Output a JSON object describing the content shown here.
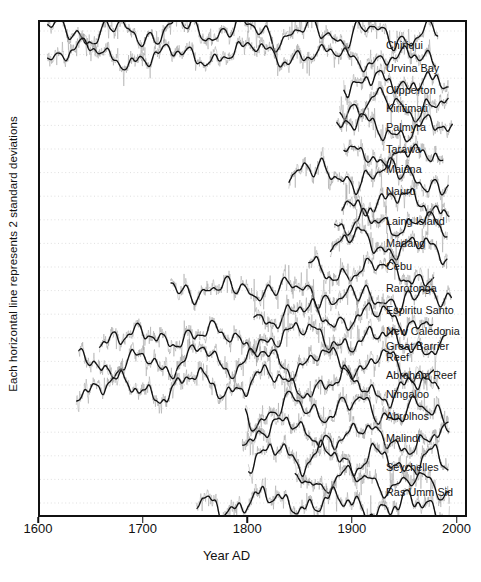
{
  "figure": {
    "axis": {
      "ylabel": "Each horizontal line represents 2 standard deviations",
      "xlabel": "Year AD",
      "xticks": [
        "1600",
        "1700",
        "1800",
        "1900",
        "2000"
      ]
    }
  },
  "chart_data": {
    "type": "line",
    "title": "",
    "xlabel": "Year AD",
    "ylabel": "Each horizontal line represents 2 standard deviations",
    "xlim": [
      1600,
      2010
    ],
    "xticks": [
      1600,
      1700,
      1800,
      1900,
      2000
    ],
    "grid": true,
    "grid_axis": "y",
    "grid_style": "dotted",
    "legend": "right-side inline labels",
    "y_axis_note": "Stacked coral oxygen-isotope records; each record offset vertically. Each horizontal gridline represents 2 standard deviations.",
    "series": [
      {
        "name": "Chiriqui",
        "label": "Chiriqui",
        "start_year": 1607,
        "end_year": 1984,
        "offset_index": 0,
        "label_y_px": 45
      },
      {
        "name": "Urvina Bay",
        "label": "Urvina Bay",
        "start_year": 1607,
        "end_year": 1982,
        "offset_index": 1,
        "label_y_px": 68
      },
      {
        "name": "Clipperton",
        "label": "Clipperton",
        "start_year": 1893,
        "end_year": 1994,
        "offset_index": 2,
        "label_y_px": 90
      },
      {
        "name": "Kiritimati",
        "label": "Kiritimati",
        "start_year": 1889,
        "end_year": 1994,
        "offset_index": 3,
        "label_y_px": 108
      },
      {
        "name": "Palmyra",
        "label": "Palmyra",
        "start_year": 1886,
        "end_year": 1998,
        "offset_index": 4,
        "label_y_px": 127
      },
      {
        "name": "Tarawa",
        "label": "Tarawa",
        "start_year": 1893,
        "end_year": 1989,
        "offset_index": 5,
        "label_y_px": 149
      },
      {
        "name": "Maiana",
        "label": "Maiana",
        "start_year": 1840,
        "end_year": 1994,
        "offset_index": 6,
        "label_y_px": 169
      },
      {
        "name": "Nauru",
        "label": "Nauru",
        "start_year": 1891,
        "end_year": 1995,
        "offset_index": 7,
        "label_y_px": 191
      },
      {
        "name": "Laing Island",
        "label": "Laing Island",
        "start_year": 1884,
        "end_year": 1993,
        "offset_index": 8,
        "label_y_px": 221
      },
      {
        "name": "Madang",
        "label": "Madang",
        "start_year": 1880,
        "end_year": 1993,
        "offset_index": 9,
        "label_y_px": 243
      },
      {
        "name": "Cebu",
        "label": "Cebu",
        "start_year": 1859,
        "end_year": 1980,
        "offset_index": 10,
        "label_y_px": 266
      },
      {
        "name": "Rarotonga",
        "label": "Rarotonga",
        "start_year": 1726,
        "end_year": 1997,
        "offset_index": 11,
        "label_y_px": 288
      },
      {
        "name": "Espiritu Santo",
        "label": "Espiritu Santo",
        "start_year": 1806,
        "end_year": 1979,
        "offset_index": 12,
        "label_y_px": 310
      },
      {
        "name": "New Caledonia",
        "label": "New Caledonia",
        "start_year": 1657,
        "end_year": 1992,
        "offset_index": 13,
        "label_y_px": 331
      },
      {
        "name": "Great Barrier Reef",
        "label": "Great Barrier\nReef",
        "start_year": 1637,
        "end_year": 1980,
        "offset_index": 14,
        "label_y_px": 351
      },
      {
        "name": "Abraham Reef",
        "label": "Abraham Reef",
        "start_year": 1635,
        "end_year": 1985,
        "offset_index": 15,
        "label_y_px": 375
      },
      {
        "name": "Ningaloo",
        "label": "Ningaloo",
        "start_year": 1798,
        "end_year": 1995,
        "offset_index": 16,
        "label_y_px": 394
      },
      {
        "name": "Abrolhos",
        "label": "Abrolhos",
        "start_year": 1795,
        "end_year": 1994,
        "offset_index": 17,
        "label_y_px": 416
      },
      {
        "name": "Malindi",
        "label": "Malindi",
        "start_year": 1801,
        "end_year": 1994,
        "offset_index": 18,
        "label_y_px": 438
      },
      {
        "name": "Seychelles",
        "label": "Seychelles",
        "start_year": 1846,
        "end_year": 1995,
        "offset_index": 19,
        "label_y_px": 467
      },
      {
        "name": "Ras Umm Sid",
        "label": "Ras Umm Sid",
        "start_year": 1751,
        "end_year": 1995,
        "offset_index": 20,
        "label_y_px": 492
      }
    ],
    "colors": {
      "raw_line": "#9a9a9a",
      "smoothed_line": "#111111",
      "grid": "#c9c9c9",
      "frame": "#111111"
    }
  }
}
